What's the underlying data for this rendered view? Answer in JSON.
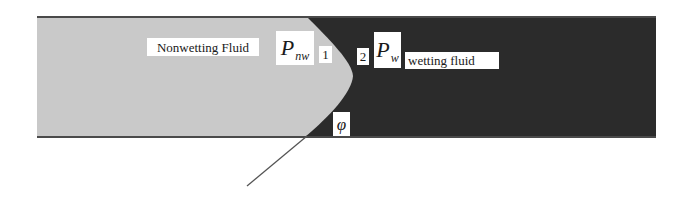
{
  "diagram": {
    "colors": {
      "nonwetting_fluid": "#c8c8c8",
      "wetting_fluid": "#2a2a2a",
      "wall_line": "#4a4a4a",
      "tangent_line": "#555555",
      "label_bg": "#ffffff",
      "background": "#ffffff"
    },
    "regions": {
      "nonwetting": {
        "label": "Nonwetting Fluid"
      },
      "wetting": {
        "label": "wetting fluid"
      }
    },
    "pressures": {
      "nonwetting": {
        "symbol": "P",
        "subscript": "nw"
      },
      "wetting": {
        "symbol": "P",
        "subscript": "w"
      }
    },
    "points": {
      "side_1": "1",
      "side_2": "2"
    },
    "contact_angle": {
      "symbol": "φ"
    }
  }
}
